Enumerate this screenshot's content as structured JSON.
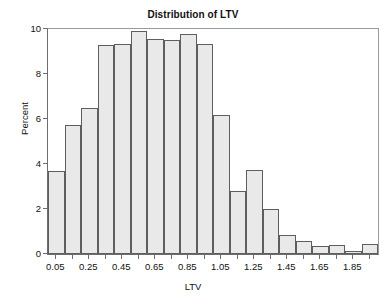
{
  "chart_data": {
    "type": "bar",
    "title": "Distribution of LTV",
    "xlabel": "LTV",
    "ylabel": "Percent",
    "grid": false,
    "legend": false,
    "bin_width": 0.1,
    "xlim": [
      0.0,
      2.0
    ],
    "ylim": [
      0,
      10
    ],
    "yticks": [
      0,
      2,
      4,
      6,
      8,
      10
    ],
    "ytick_labels": [
      "0",
      "2",
      "4",
      "6",
      "8",
      "10"
    ],
    "xticks": [
      0.05,
      0.25,
      0.45,
      0.65,
      0.85,
      1.05,
      1.25,
      1.45,
      1.65,
      1.85
    ],
    "xtick_labels": [
      "0.05",
      "0.25",
      "0.45",
      "0.65",
      "0.85",
      "1.05",
      "1.25",
      "1.45",
      "1.65",
      "1.85"
    ],
    "bin_centers": [
      0.05,
      0.15,
      0.25,
      0.35,
      0.45,
      0.55,
      0.65,
      0.75,
      0.85,
      0.95,
      1.05,
      1.15,
      1.25,
      1.35,
      1.45,
      1.55,
      1.65,
      1.75,
      1.85,
      1.95
    ],
    "bin_edges": [
      0.0,
      0.1,
      0.2,
      0.3,
      0.4,
      0.5,
      0.6,
      0.7,
      0.8,
      0.9,
      1.0,
      1.1,
      1.2,
      1.3,
      1.4,
      1.5,
      1.6,
      1.7,
      1.8,
      1.9,
      2.0
    ],
    "categories": [
      "0.05",
      "0.15",
      "0.25",
      "0.35",
      "0.45",
      "0.55",
      "0.65",
      "0.75",
      "0.85",
      "0.95",
      "1.05",
      "1.15",
      "1.25",
      "1.35",
      "1.45",
      "1.55",
      "1.65",
      "1.75",
      "1.85",
      "1.95"
    ],
    "values": [
      3.7,
      5.75,
      6.5,
      9.3,
      9.35,
      9.9,
      9.55,
      9.5,
      9.8,
      9.35,
      6.2,
      2.8,
      3.75,
      2.0,
      0.85,
      0.6,
      0.35,
      0.4,
      0.15,
      0.45
    ],
    "bar_fill_color": "#e9e9e9",
    "bar_edge_color": "#5e5e5e",
    "axis_color": "#6d6d6d",
    "text_color": "#111111"
  }
}
